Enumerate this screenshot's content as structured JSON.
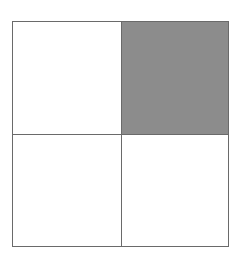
{
  "diagram": {
    "type": "2x2 grid",
    "rows": 2,
    "cols": 2,
    "cells": [
      {
        "row": 0,
        "col": 0,
        "shaded": false,
        "color": "#ffffff"
      },
      {
        "row": 0,
        "col": 1,
        "shaded": true,
        "color": "#8c8c8c"
      },
      {
        "row": 1,
        "col": 0,
        "shaded": false,
        "color": "#ffffff"
      },
      {
        "row": 1,
        "col": 1,
        "shaded": false,
        "color": "#ffffff"
      }
    ],
    "border_color": "#6a6a6a"
  }
}
